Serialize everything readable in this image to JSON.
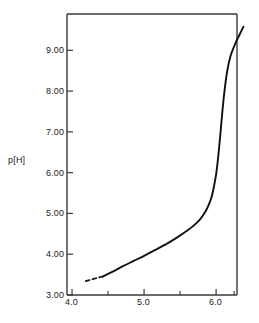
{
  "chart_data": {
    "type": "line",
    "title": "",
    "subtitle": "",
    "xlabel": "",
    "ylabel": "p[H]",
    "ylabel_parts": {
      "lead": "p",
      "bracket": "[H]"
    },
    "xlim": [
      3.93,
      6.29
    ],
    "ylim": [
      3.0,
      9.89
    ],
    "x_ticks_major": [
      "4.0",
      "5.0",
      "6.0"
    ],
    "x_ticks_major_values": [
      4.0,
      5.0,
      6.0
    ],
    "x_ticks_minor_values": [
      4.5,
      5.5,
      6.25
    ],
    "y_ticks_major": [
      "3.00",
      "4.00",
      "5.00",
      "6.00",
      "7.00",
      "8.00",
      "9.00"
    ],
    "y_ticks_major_values": [
      3.0,
      4.0,
      5.0,
      6.0,
      7.0,
      8.0,
      9.0
    ],
    "grid": false,
    "legend": null,
    "legend_position": "none",
    "line_color": "#111111",
    "frame_color": "#3a3a3a",
    "series": [
      {
        "name": "titration-curve-dashed",
        "style": "dashed",
        "x": [
          4.19,
          4.25,
          4.31,
          4.37,
          4.42
        ],
        "y": [
          3.34,
          3.37,
          3.4,
          3.43,
          3.45
        ]
      },
      {
        "name": "titration-curve-solid",
        "style": "solid",
        "x": [
          4.42,
          4.55,
          4.7,
          4.85,
          5.0,
          5.15,
          5.3,
          5.45,
          5.6,
          5.7,
          5.78,
          5.85,
          5.9,
          5.94,
          5.97,
          6.0,
          6.02,
          6.04,
          6.06,
          6.08,
          6.11,
          6.15,
          6.2,
          6.27,
          6.33,
          6.38
        ],
        "y": [
          3.45,
          3.56,
          3.7,
          3.83,
          3.96,
          4.1,
          4.24,
          4.4,
          4.58,
          4.72,
          4.86,
          5.04,
          5.22,
          5.42,
          5.66,
          5.96,
          6.24,
          6.58,
          6.96,
          7.36,
          7.9,
          8.45,
          8.86,
          9.18,
          9.4,
          9.58
        ]
      }
    ]
  },
  "axes": {
    "frame": {
      "left": 67,
      "right": 237,
      "top": 14,
      "bottom": 295
    }
  }
}
